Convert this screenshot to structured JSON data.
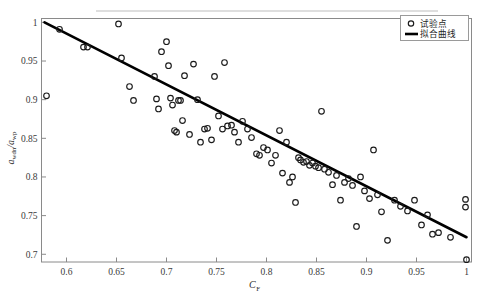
{
  "chart_data": {
    "type": "scatter",
    "title": "",
    "xlabel": "C_F",
    "xlabel_base": "C",
    "xlabel_sub": "F",
    "ylabel": "a_wdn / a_wp",
    "ylabel_num_base": "a",
    "ylabel_num_sub": "wdn",
    "ylabel_den_base": "a",
    "ylabel_den_sub": "wp",
    "xlim": [
      0.575,
      1.005
    ],
    "ylim": [
      0.69,
      1.005
    ],
    "xticks": [
      0.6,
      0.65,
      0.7,
      0.75,
      0.8,
      0.85,
      0.9,
      0.95,
      1
    ],
    "xticklabels": [
      "0.6",
      "0.65",
      "0.7",
      "0.75",
      "0.8",
      "0.85",
      "0.9",
      "0.95",
      "1"
    ],
    "yticks": [
      0.7,
      0.75,
      0.8,
      0.85,
      0.9,
      0.95,
      1
    ],
    "yticklabels": [
      "0.7",
      "0.75",
      "0.8",
      "0.85",
      "0.9",
      "0.95",
      "1"
    ],
    "grid": false,
    "legend_position": "top-right",
    "series": [
      {
        "name": "试验点",
        "marker": "open-circle",
        "color": "#1a1a1a",
        "points": [
          [
            0.58,
            0.905
          ],
          [
            0.593,
            0.991
          ],
          [
            0.617,
            0.968
          ],
          [
            0.621,
            0.968
          ],
          [
            0.652,
            0.998
          ],
          [
            0.655,
            0.954
          ],
          [
            0.663,
            0.917
          ],
          [
            0.667,
            0.899
          ],
          [
            0.688,
            0.93
          ],
          [
            0.69,
            0.901
          ],
          [
            0.692,
            0.888
          ],
          [
            0.695,
            0.962
          ],
          [
            0.7,
            0.975
          ],
          [
            0.702,
            0.944
          ],
          [
            0.704,
            0.902
          ],
          [
            0.706,
            0.893
          ],
          [
            0.708,
            0.86
          ],
          [
            0.71,
            0.858
          ],
          [
            0.712,
            0.899
          ],
          [
            0.714,
            0.899
          ],
          [
            0.716,
            0.873
          ],
          [
            0.718,
            0.931
          ],
          [
            0.723,
            0.855
          ],
          [
            0.727,
            0.946
          ],
          [
            0.731,
            0.9
          ],
          [
            0.734,
            0.845
          ],
          [
            0.738,
            0.862
          ],
          [
            0.741,
            0.863
          ],
          [
            0.745,
            0.848
          ],
          [
            0.748,
            0.93
          ],
          [
            0.752,
            0.879
          ],
          [
            0.756,
            0.862
          ],
          [
            0.758,
            0.948
          ],
          [
            0.761,
            0.866
          ],
          [
            0.765,
            0.867
          ],
          [
            0.768,
            0.858
          ],
          [
            0.772,
            0.845
          ],
          [
            0.776,
            0.872
          ],
          [
            0.781,
            0.862
          ],
          [
            0.785,
            0.851
          ],
          [
            0.79,
            0.83
          ],
          [
            0.793,
            0.828
          ],
          [
            0.797,
            0.838
          ],
          [
            0.801,
            0.835
          ],
          [
            0.805,
            0.818
          ],
          [
            0.809,
            0.828
          ],
          [
            0.813,
            0.86
          ],
          [
            0.816,
            0.805
          ],
          [
            0.82,
            0.845
          ],
          [
            0.823,
            0.793
          ],
          [
            0.826,
            0.8
          ],
          [
            0.829,
            0.767
          ],
          [
            0.832,
            0.825
          ],
          [
            0.834,
            0.822
          ],
          [
            0.837,
            0.819
          ],
          [
            0.84,
            0.82
          ],
          [
            0.843,
            0.815
          ],
          [
            0.846,
            0.818
          ],
          [
            0.849,
            0.814
          ],
          [
            0.852,
            0.812
          ],
          [
            0.855,
            0.885
          ],
          [
            0.858,
            0.81
          ],
          [
            0.862,
            0.806
          ],
          [
            0.866,
            0.79
          ],
          [
            0.87,
            0.802
          ],
          [
            0.874,
            0.77
          ],
          [
            0.878,
            0.793
          ],
          [
            0.882,
            0.798
          ],
          [
            0.886,
            0.789
          ],
          [
            0.89,
            0.736
          ],
          [
            0.894,
            0.8
          ],
          [
            0.898,
            0.782
          ],
          [
            0.903,
            0.772
          ],
          [
            0.907,
            0.835
          ],
          [
            0.911,
            0.777
          ],
          [
            0.915,
            0.755
          ],
          [
            0.921,
            0.718
          ],
          [
            0.928,
            0.77
          ],
          [
            0.934,
            0.762
          ],
          [
            0.941,
            0.756
          ],
          [
            0.948,
            0.77
          ],
          [
            0.955,
            0.738
          ],
          [
            0.961,
            0.751
          ],
          [
            0.966,
            0.726
          ],
          [
            0.972,
            0.728
          ],
          [
            0.984,
            0.722
          ],
          [
            0.999,
            0.771
          ],
          [
            0.999,
            0.761
          ],
          [
            1.0,
            0.693
          ]
        ]
      }
    ],
    "fit": {
      "name": "拟合曲线",
      "color": "#000000",
      "x_start": 0.578,
      "y_start": 1.0,
      "x_end": 1.0,
      "y_end": 0.722
    }
  },
  "legend": {
    "items": [
      {
        "label": "试验点",
        "marker": "open-circle"
      },
      {
        "label": "拟合曲线",
        "marker": "line"
      }
    ]
  }
}
